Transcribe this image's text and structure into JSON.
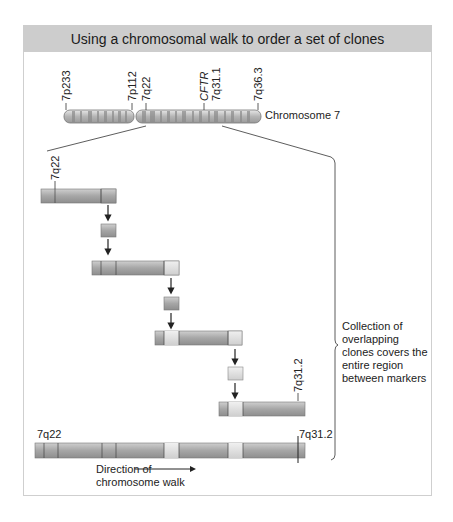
{
  "title": "Using a chromosomal walk to order a set of clones",
  "chromosome": {
    "label": "Chromosome 7",
    "markers": [
      "7p233",
      "7p112",
      "7q22",
      "CFTR",
      "7q31.1",
      "7q36.3"
    ]
  },
  "clones": [
    {
      "marker": "7q22"
    },
    {
      "marker": ""
    },
    {
      "marker": ""
    },
    {
      "marker": "7q31.2"
    }
  ],
  "contig": {
    "left_marker": "7q22",
    "right_marker": "7q31.2"
  },
  "brace_note": "Collection of overlapping clones covers the entire region between markers",
  "direction": {
    "line1": "Direction of",
    "line2": "chromosome walk"
  },
  "colors": {
    "title_bg": "#cdcdcd",
    "clone_dark": "#a9a9a9",
    "clone_light": "#e2e2e2",
    "line": "#333333"
  }
}
